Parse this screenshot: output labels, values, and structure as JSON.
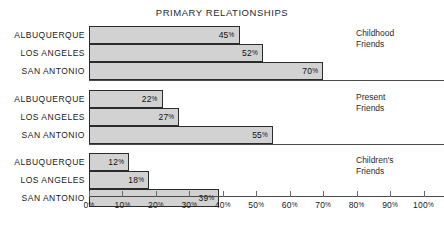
{
  "chart_data": {
    "type": "bar",
    "orientation": "horizontal",
    "title": "PRIMARY RELATIONSHIPS",
    "xlabel": "",
    "ylabel": "",
    "xlim": [
      0,
      100
    ],
    "xtick_values": [
      0,
      10,
      20,
      30,
      40,
      50,
      60,
      70,
      80,
      90,
      100
    ],
    "xtick_labels": [
      "0%",
      "10%",
      "20%",
      "30%",
      "40%",
      "50%",
      "60%",
      "70%",
      "80%",
      "90%",
      "100%"
    ],
    "grid": false,
    "legend_position": "right",
    "categories": [
      "ALBUQUERQUE",
      "LOS ANGELES",
      "SAN ANTONIO"
    ],
    "unit": "%",
    "groups": [
      {
        "legend_line1": "Childhood",
        "legend_line2": "Friends",
        "bars": [
          {
            "category": "ALBUQUERQUE",
            "value": 45,
            "label": "45",
            "unit": "%"
          },
          {
            "category": "LOS ANGELES",
            "value": 52,
            "label": "52",
            "unit": "%"
          },
          {
            "category": "SAN ANTONIO",
            "value": 70,
            "label": "70",
            "unit": "%"
          }
        ]
      },
      {
        "legend_line1": "Present",
        "legend_line2": "Friends",
        "bars": [
          {
            "category": "ALBUQUERQUE",
            "value": 22,
            "label": "22",
            "unit": "%"
          },
          {
            "category": "LOS ANGELES",
            "value": 27,
            "label": "27",
            "unit": "%"
          },
          {
            "category": "SAN ANTONIO",
            "value": 55,
            "label": "55",
            "unit": "%"
          }
        ]
      },
      {
        "legend_line1": "Children's",
        "legend_line2": "Friends",
        "bars": [
          {
            "category": "ALBUQUERQUE",
            "value": 12,
            "label": "12",
            "unit": "%"
          },
          {
            "category": "LOS ANGELES",
            "value": 18,
            "label": "18",
            "unit": "%"
          },
          {
            "category": "SAN ANTONIO",
            "value": 39,
            "label": "39",
            "unit": "%"
          }
        ]
      }
    ],
    "series": [
      {
        "name": "Childhood Friends",
        "values": [
          45,
          52,
          70
        ]
      },
      {
        "name": "Present Friends",
        "values": [
          22,
          27,
          55
        ]
      },
      {
        "name": "Children's Friends",
        "values": [
          12,
          18,
          39
        ]
      }
    ],
    "colors": {
      "bar_fill": "#d2d2d2",
      "bar_stroke": "#2b2b2b",
      "axis": "#4a4a4a",
      "text": "#1a1a1a",
      "background": "#ffffff"
    }
  }
}
